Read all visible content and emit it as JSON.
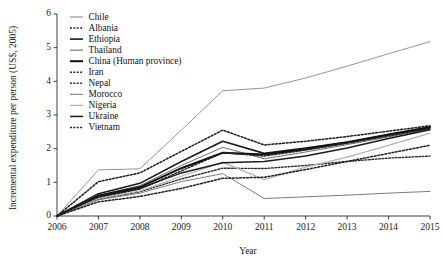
{
  "chart_data": {
    "type": "line",
    "title": "",
    "xlabel": "Year",
    "ylabel": "Incremental expenditure per person (US$, 2005)",
    "x": [
      2006,
      2007,
      2008,
      2009,
      2010,
      2011,
      2012,
      2013,
      2014,
      2015
    ],
    "xtick_labels": [
      "2006",
      "2007",
      "2008",
      "2009",
      "2010",
      "2011",
      "2012",
      "2013",
      "2014",
      "2015"
    ],
    "ytick_labels": [
      "0",
      "1",
      "2",
      "3",
      "4",
      "5",
      "6"
    ],
    "xlim": [
      2006,
      2015
    ],
    "ylim": [
      0,
      6
    ],
    "yticks": [
      0,
      1,
      2,
      3,
      4,
      5,
      6
    ],
    "grid": false,
    "legend_position": "top-left-inside",
    "series": [
      {
        "name": "Chile",
        "style": "solid",
        "color": "#8a8a8a",
        "width": 0.9,
        "values": [
          0.0,
          1.37,
          1.4,
          2.55,
          3.72,
          3.8,
          4.1,
          4.45,
          4.82,
          5.18
        ]
      },
      {
        "name": "Albania",
        "style": "dashed",
        "color": "#1b1b1b",
        "width": 1.5,
        "values": [
          0.0,
          1.02,
          1.28,
          1.92,
          2.55,
          2.11,
          2.22,
          2.36,
          2.52,
          2.68
        ]
      },
      {
        "name": "Ethiopia",
        "style": "solid",
        "color": "#1b1b1b",
        "width": 1.6,
        "values": [
          0.0,
          0.66,
          0.97,
          1.62,
          2.22,
          1.86,
          2.02,
          2.2,
          2.43,
          2.65
        ]
      },
      {
        "name": "Thailand",
        "style": "solid",
        "color": "#6f6f6f",
        "width": 1.0,
        "values": [
          0.0,
          0.62,
          0.9,
          1.5,
          2.04,
          1.7,
          1.9,
          2.12,
          2.35,
          2.58
        ]
      },
      {
        "name": "China (Human province)",
        "style": "solid",
        "color": "#101010",
        "width": 2.0,
        "values": [
          0.0,
          0.6,
          0.86,
          1.42,
          1.88,
          1.83,
          1.98,
          2.18,
          2.41,
          2.62
        ]
      },
      {
        "name": "Iran",
        "style": "dashed",
        "color": "#232323",
        "width": 1.5,
        "values": [
          0.0,
          0.55,
          0.8,
          1.34,
          1.88,
          1.78,
          1.96,
          2.16,
          2.38,
          2.6
        ]
      },
      {
        "name": "Nepal",
        "style": "dashed",
        "color": "#2b2b2b",
        "width": 1.4,
        "values": [
          0.0,
          0.5,
          0.72,
          1.1,
          1.42,
          1.41,
          1.5,
          1.62,
          1.72,
          1.78
        ]
      },
      {
        "name": "Morocco",
        "style": "solid",
        "color": "#7d7d7d",
        "width": 1.0,
        "values": [
          0.0,
          0.48,
          0.68,
          1.02,
          1.26,
          0.52,
          0.57,
          0.62,
          0.68,
          0.73
        ]
      },
      {
        "name": "Nigeria",
        "style": "solid",
        "color": "#b3b3b3",
        "width": 1.2,
        "values": [
          0.0,
          0.52,
          0.74,
          1.18,
          1.6,
          1.08,
          1.45,
          1.75,
          2.1,
          2.46
        ]
      },
      {
        "name": "Ukraine",
        "style": "solid",
        "color": "#1b1b1b",
        "width": 1.5,
        "values": [
          0.0,
          0.58,
          0.82,
          1.28,
          1.58,
          1.62,
          1.78,
          2.02,
          2.3,
          2.56
        ]
      },
      {
        "name": "Vietnam",
        "style": "dashed",
        "color": "#1f1f1f",
        "width": 1.5,
        "values": [
          0.0,
          0.42,
          0.58,
          0.82,
          1.12,
          1.15,
          1.38,
          1.62,
          1.86,
          2.1
        ]
      }
    ]
  }
}
